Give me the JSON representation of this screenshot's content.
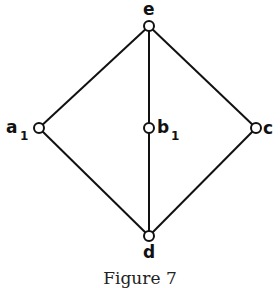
{
  "diagram": {
    "type": "hasse-diagram",
    "nodes": [
      {
        "id": "e",
        "label": "e",
        "subscript": "",
        "x": 149,
        "y": 26
      },
      {
        "id": "a1",
        "label": "a",
        "subscript": "1",
        "x": 39,
        "y": 128
      },
      {
        "id": "b1",
        "label": "b",
        "subscript": "1",
        "x": 149,
        "y": 128
      },
      {
        "id": "c",
        "label": "c",
        "subscript": "",
        "x": 256,
        "y": 128
      },
      {
        "id": "d",
        "label": "d",
        "subscript": "",
        "x": 149,
        "y": 236
      }
    ],
    "edges": [
      [
        "e",
        "a1"
      ],
      [
        "e",
        "b1"
      ],
      [
        "e",
        "c"
      ],
      [
        "a1",
        "d"
      ],
      [
        "b1",
        "d"
      ],
      [
        "c",
        "d"
      ]
    ],
    "labels": {
      "e": "e",
      "a": "a",
      "a_sub": "1",
      "b": "b",
      "b_sub": "1",
      "c": "c",
      "d": "d"
    }
  },
  "caption": "Figure 7"
}
